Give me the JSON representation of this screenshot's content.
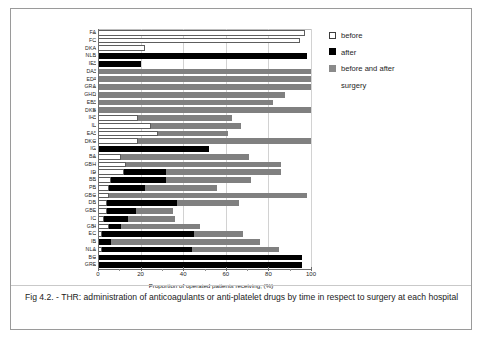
{
  "figure": {
    "caption": "Fig 4.2. - THR:  administration of anticoagulants or anti-platelet drugs  by time in respect to surgery at each hospital"
  },
  "legend": {
    "items": [
      {
        "label": "before",
        "color": "#ffffff",
        "swatch": "before"
      },
      {
        "label": "after",
        "color": "#000000",
        "swatch": "after"
      },
      {
        "label": "before and after",
        "color": "#808080",
        "swatch": "both"
      }
    ],
    "continuation": "surgery"
  },
  "axes": {
    "x_title": "Proportion of operated patients receiving,  (%)",
    "x_ticks": [
      "0",
      "20",
      "40",
      "60",
      "80",
      "100"
    ],
    "x_tick_values": [
      0,
      20,
      40,
      60,
      80,
      100
    ],
    "x_min": 0,
    "x_max": 100
  },
  "chart_data": {
    "type": "bar",
    "orientation": "horizontal",
    "stacked": true,
    "title": "THR: administration of anticoagulants or anti-platelet drugs by time in respect to surgery at each hospital",
    "xlabel": "Proportion of operated patients receiving,  (%)",
    "ylabel": "",
    "xlim": [
      0,
      100
    ],
    "grid": true,
    "legend_position": "right",
    "categories": [
      "FA",
      "FC",
      "DKA",
      "NLB",
      "IE*",
      "DA*",
      "ED*",
      "GRA",
      "GHD",
      "EB*",
      "DKB",
      "IH*",
      "IL",
      "EA*",
      "DKC",
      "IG",
      "BA",
      "GBH",
      "ID",
      "BB",
      "PB",
      "GBC",
      "DB",
      "GBF",
      "IC",
      "GBI",
      "EC",
      "IB",
      "NLA",
      "BC",
      "GRF"
    ],
    "series": [
      {
        "name": "before",
        "color": "#ffffff",
        "values": [
          97,
          95,
          22,
          0,
          0,
          0,
          0,
          0,
          0,
          0,
          0,
          19,
          25,
          28,
          19,
          0,
          11,
          13,
          12,
          6,
          5,
          5,
          4,
          4,
          3,
          5,
          2,
          0,
          2,
          0,
          0
        ]
      },
      {
        "name": "after",
        "color": "#000000",
        "values": [
          0,
          0,
          0,
          98,
          20,
          0,
          0,
          0,
          0,
          0,
          0,
          0,
          0,
          0,
          0,
          52,
          0,
          0,
          20,
          26,
          17,
          0,
          33,
          14,
          11,
          6,
          43,
          6,
          42,
          96,
          96
        ]
      },
      {
        "name": "before and after",
        "color": "#808080",
        "values": [
          0,
          0,
          0,
          0,
          0,
          100,
          100,
          100,
          88,
          82,
          100,
          44,
          42,
          33,
          81,
          0,
          60,
          73,
          54,
          40,
          34,
          93,
          29,
          17,
          22,
          37,
          23,
          70,
          41,
          0,
          0
        ]
      }
    ]
  },
  "rows": [
    {
      "label": "FA",
      "before": 97,
      "after": 0,
      "both": 0
    },
    {
      "label": "FC",
      "before": 95,
      "after": 0,
      "both": 0
    },
    {
      "label": "DKA",
      "before": 22,
      "after": 0,
      "both": 0
    },
    {
      "label": "NLB",
      "before": 0,
      "after": 98,
      "both": 0
    },
    {
      "label": "IE*",
      "before": 0,
      "after": 20,
      "both": 0
    },
    {
      "label": "DA*",
      "before": 0,
      "after": 0,
      "both": 100
    },
    {
      "label": "ED*",
      "before": 0,
      "after": 0,
      "both": 100
    },
    {
      "label": "GRA",
      "before": 0,
      "after": 0,
      "both": 100
    },
    {
      "label": "GHD",
      "before": 0,
      "after": 0,
      "both": 88
    },
    {
      "label": "EB*",
      "before": 0,
      "after": 0,
      "both": 82
    },
    {
      "label": "DKB",
      "before": 0,
      "after": 0,
      "both": 100
    },
    {
      "label": "IH*",
      "before": 19,
      "after": 0,
      "both": 44
    },
    {
      "label": "IL",
      "before": 25,
      "after": 0,
      "both": 42
    },
    {
      "label": "EA*",
      "before": 28,
      "after": 0,
      "both": 33
    },
    {
      "label": "DKC",
      "before": 19,
      "after": 0,
      "both": 81
    },
    {
      "label": "IG",
      "before": 0,
      "after": 52,
      "both": 0
    },
    {
      "label": "BA",
      "before": 11,
      "after": 0,
      "both": 60
    },
    {
      "label": "GBH",
      "before": 13,
      "after": 0,
      "both": 73
    },
    {
      "label": "ID",
      "before": 12,
      "after": 20,
      "both": 54
    },
    {
      "label": "BB",
      "before": 6,
      "after": 26,
      "both": 40
    },
    {
      "label": "PB",
      "before": 5,
      "after": 17,
      "both": 34
    },
    {
      "label": "GBC",
      "before": 5,
      "after": 0,
      "both": 93
    },
    {
      "label": "DB",
      "before": 4,
      "after": 33,
      "both": 29
    },
    {
      "label": "GBF",
      "before": 4,
      "after": 14,
      "both": 17
    },
    {
      "label": "IC",
      "before": 3,
      "after": 11,
      "both": 22
    },
    {
      "label": "GBI",
      "before": 5,
      "after": 6,
      "both": 37
    },
    {
      "label": "EC",
      "before": 2,
      "after": 43,
      "both": 23
    },
    {
      "label": "IB",
      "before": 0,
      "after": 6,
      "both": 70
    },
    {
      "label": "NLA",
      "before": 2,
      "after": 42,
      "both": 41
    },
    {
      "label": "BC",
      "before": 0,
      "after": 96,
      "both": 0
    },
    {
      "label": "GRF",
      "before": 0,
      "after": 96,
      "both": 0
    }
  ]
}
